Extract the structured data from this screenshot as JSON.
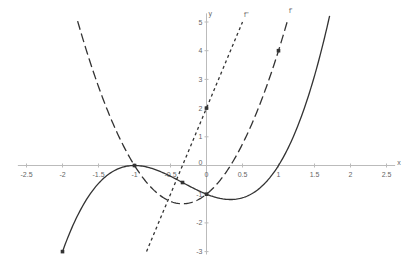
{
  "chart_data": {
    "type": "line",
    "title": "",
    "xlabel": "x",
    "ylabel": "y",
    "xlim": [
      -2.5,
      2.5
    ],
    "ylim": [
      -3,
      5
    ],
    "grid": false,
    "x_ticks": [
      -2.5,
      -2,
      -1.5,
      -1,
      -0.5,
      0,
      0.5,
      1,
      1.5,
      2,
      2.5
    ],
    "x_tick_labels": [
      "-2.5",
      "-2",
      "-1.5",
      "-1",
      "-0.5",
      "0",
      "0.5",
      "1",
      "1.5",
      "2",
      "2.5"
    ],
    "y_ticks": [
      -3,
      -2,
      -1,
      0,
      1,
      2,
      3,
      4,
      5
    ],
    "y_tick_labels": [
      "-3",
      "-2",
      "-1",
      "0",
      "1",
      "2",
      "3",
      "4",
      "5"
    ],
    "series": [
      {
        "name": "f",
        "label": "",
        "style": "solid",
        "expression": "x^3 + x^2 - x - 1",
        "x_range": [
          -2,
          1.71
        ],
        "x": [
          -2,
          -1.5,
          -1,
          -0.5,
          0,
          0.5,
          1,
          1.5
        ],
        "y": [
          -3,
          -0.625,
          0,
          -0.375,
          -1,
          -1.125,
          0,
          3.125
        ]
      },
      {
        "name": "f'",
        "label": "f'",
        "style": "dashed",
        "expression": "3x^2 + 2x - 1",
        "x_range": [
          -1.79,
          1.12
        ],
        "x": [
          -1.5,
          -1,
          -0.5,
          -0.333,
          0,
          0.5,
          1
        ],
        "y": [
          2.75,
          0,
          -1.25,
          -1.333,
          -1,
          0.75,
          4
        ]
      },
      {
        "name": "f''",
        "label": "f''",
        "style": "dotted",
        "expression": "6x + 2",
        "x_range": [
          -0.833,
          0.5
        ],
        "x": [
          -0.833,
          -0.333,
          0,
          0.5
        ],
        "y": [
          -3,
          0,
          2,
          5
        ]
      }
    ],
    "points": [
      {
        "x": -2,
        "y": -3
      },
      {
        "x": -1,
        "y": 0
      },
      {
        "x": -0.333,
        "y": -0.593
      },
      {
        "x": 0,
        "y": -1
      },
      {
        "x": 0,
        "y": 2
      },
      {
        "x": 1,
        "y": 4
      }
    ]
  },
  "axes": {
    "x_name": "x",
    "y_name": "y",
    "origin_label": "0"
  },
  "labels": {
    "f_prime": "f'",
    "f_double_prime": "f''"
  },
  "colors": {
    "axis": "#bbbbbb",
    "curve": "#333333",
    "tick_label": "#666666"
  }
}
